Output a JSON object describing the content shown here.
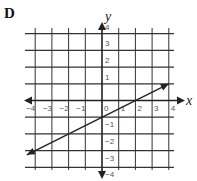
{
  "panel_label": "D",
  "chart_data": {
    "type": "line",
    "title": "",
    "xlabel": "x",
    "ylabel": "y",
    "xlim": [
      -4.5,
      4.5
    ],
    "ylim": [
      -4,
      4
    ],
    "grid": true,
    "x_ticks": [
      "-4",
      "-3",
      "-2",
      "-1",
      "0",
      "1",
      "2",
      "3",
      "4"
    ],
    "y_ticks": [
      "4",
      "3",
      "2",
      "1",
      "-1",
      "-2",
      "-3",
      "-4"
    ],
    "series": [
      {
        "name": "line",
        "equation": "y = 0.5x - 1",
        "slope": 0.5,
        "intercept": -1,
        "x": [
          -4.5,
          4
        ],
        "y": [
          -3.25,
          1
        ],
        "arrows_both_ends": true
      }
    ],
    "colors": {
      "grid": "#333333",
      "axis": "#222222",
      "line": "#222222"
    }
  }
}
